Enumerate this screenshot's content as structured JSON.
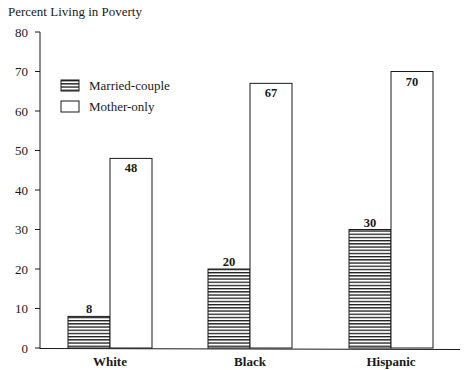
{
  "chart_data": {
    "type": "bar",
    "title": "",
    "ylabel": "Percent Living in Poverty",
    "xlabel": "",
    "categories": [
      "White",
      "Black",
      "Hispanic"
    ],
    "series": [
      {
        "name": "Married-couple",
        "values": [
          8,
          20,
          30
        ],
        "pattern": "horizontal-stripes"
      },
      {
        "name": "Mother-only",
        "values": [
          48,
          67,
          70
        ],
        "pattern": "white"
      }
    ],
    "ylim": [
      0,
      80
    ],
    "yticks": [
      0,
      10,
      20,
      30,
      40,
      50,
      60,
      70,
      80
    ],
    "grid": false,
    "legend_position": "upper-left",
    "data_labels": true
  },
  "colors": {
    "ink": "#1a1a1a",
    "fill": "#ffffff"
  }
}
